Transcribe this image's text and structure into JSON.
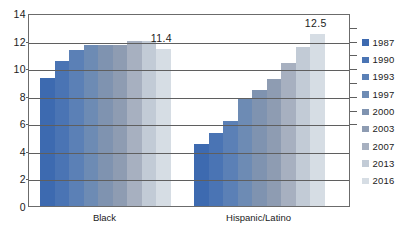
{
  "chart_data": {
    "type": "bar",
    "title": "",
    "subtitle": "",
    "xlabel": "",
    "ylabel": "",
    "ylim": [
      0,
      14
    ],
    "ytick_values": [
      0,
      2,
      4,
      6,
      8,
      10,
      12,
      14
    ],
    "ytick_labels": [
      "0",
      "2",
      "4",
      "6",
      "8",
      "10",
      "12",
      "14"
    ],
    "grid": true,
    "grid_axis": "y",
    "legend_position": "right",
    "categories": [
      "Black",
      "Hispanic/Latino"
    ],
    "series": [
      {
        "name": "1987",
        "color": "#3d6ab0",
        "values": [
          9.3,
          4.5
        ]
      },
      {
        "name": "1990",
        "color": "#4a74b4",
        "values": [
          10.5,
          5.3
        ]
      },
      {
        "name": "1993",
        "color": "#5b80b6",
        "values": [
          11.3,
          6.2
        ]
      },
      {
        "name": "1997",
        "color": "#6d8bb4",
        "values": [
          11.7,
          7.8
        ]
      },
      {
        "name": "2000",
        "color": "#7f93b0",
        "values": [
          11.7,
          8.4
        ]
      },
      {
        "name": "2003",
        "color": "#8e9cb2",
        "values": [
          11.7,
          9.2
        ]
      },
      {
        "name": "2007",
        "color": "#a7b0c0",
        "values": [
          12.0,
          10.4
        ]
      },
      {
        "name": "2013",
        "color": "#c2cbd6",
        "values": [
          12.0,
          11.5
        ]
      },
      {
        "name": "2016",
        "color": "#d6dde4",
        "values": [
          11.4,
          12.5
        ]
      }
    ],
    "annotations": [
      {
        "text": "11.4",
        "category": "Black",
        "series": "2016",
        "value": 11.4
      },
      {
        "text": "12.5",
        "category": "Hispanic/Latino",
        "series": "2016",
        "value": 12.5
      }
    ]
  },
  "legend": {
    "items": [
      {
        "label": "1987",
        "color": "#3d6ab0"
      },
      {
        "label": "1990",
        "color": "#4a74b4"
      },
      {
        "label": "1993",
        "color": "#5b80b6"
      },
      {
        "label": "1997",
        "color": "#6d8bb4"
      },
      {
        "label": "2000",
        "color": "#7f93b0"
      },
      {
        "label": "2003",
        "color": "#8e9cb2"
      },
      {
        "label": "2007",
        "color": "#a7b0c0"
      },
      {
        "label": "2013",
        "color": "#c2cbd6"
      },
      {
        "label": "2016",
        "color": "#d6dde4"
      }
    ]
  },
  "axis": {
    "frame_color": "#5f5f5f",
    "tick_color": "#5f5f5f",
    "text_color": "#1b1b1b"
  }
}
